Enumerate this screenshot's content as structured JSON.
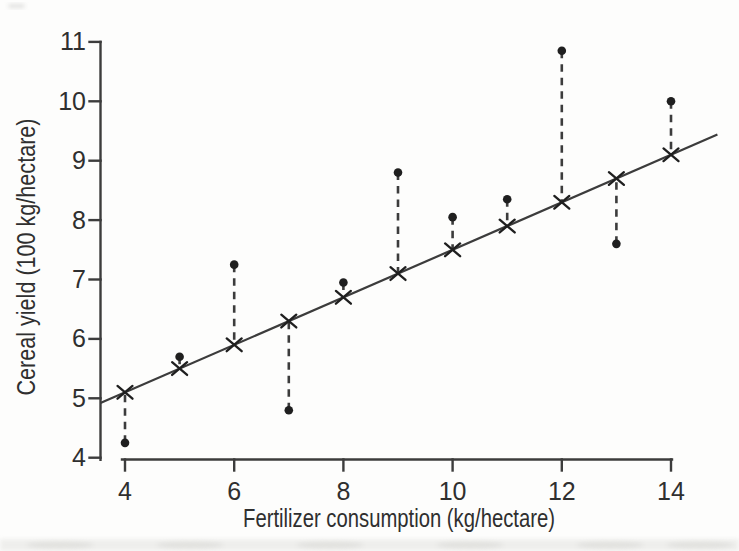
{
  "figure": {
    "background": "#fdfdfc",
    "ink_color": "#2f2f2f",
    "line_color": "#3c3c3c",
    "marker_color": "#1f1f1f"
  },
  "chart_data": {
    "type": "scatter",
    "title": "",
    "xlabel": "Fertilizer consumption (kg/hectare)",
    "ylabel": "Cereal yield (100 kg/hectare)",
    "x_ticks": [
      4,
      6,
      8,
      10,
      12,
      14
    ],
    "y_ticks": [
      4,
      5,
      6,
      7,
      8,
      9,
      10,
      11
    ],
    "xlim": [
      3.55,
      14.85
    ],
    "ylim": [
      4,
      11
    ],
    "grid": false,
    "legend": "none",
    "x": [
      4,
      5,
      6,
      7,
      8,
      9,
      10,
      11,
      12,
      13,
      14
    ],
    "series": [
      {
        "name": "observed",
        "marker": "filled-dot",
        "values": [
          4.25,
          5.7,
          7.25,
          4.8,
          6.95,
          8.8,
          8.05,
          8.35,
          10.85,
          7.6,
          10.0
        ]
      },
      {
        "name": "fitted",
        "marker": "x-cross",
        "values": [
          5.1,
          5.5,
          5.9,
          6.3,
          6.7,
          7.1,
          7.5,
          7.9,
          8.3,
          8.7,
          9.1
        ]
      }
    ],
    "fit_line": {
      "slope": 0.4,
      "intercept": 3.5,
      "x_start": 3.55,
      "x_end": 14.85
    },
    "residuals_shown_as": "vertical dashed connectors between observed dots and fitted crosses"
  }
}
